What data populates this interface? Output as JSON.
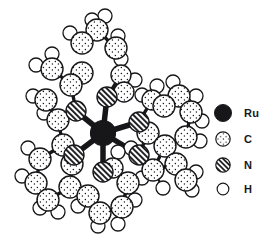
{
  "figure": {
    "kind": "molecular-structure-diagram",
    "background_color": "#ffffff",
    "line_color": "#17171a"
  },
  "legend": {
    "position": "right",
    "items": [
      {
        "key": "Ru",
        "label": "Ru",
        "swatch": "filled-black-circle",
        "color": "#17171a",
        "radius_px": 9.5
      },
      {
        "key": "C",
        "label": "C",
        "swatch": "stippled-circle",
        "color": "#ffffff",
        "radius_px": 8.0
      },
      {
        "key": "N",
        "label": "N",
        "swatch": "diagonal-hatched-circle",
        "color": "#ffffff",
        "radius_px": 8.0
      },
      {
        "key": "H",
        "label": "H",
        "swatch": "open-circle",
        "color": "#ffffff",
        "radius_px": 6.5
      }
    ]
  },
  "chart_data": {
    "type": "scatter",
    "title": "",
    "xlabel": "",
    "ylabel": "",
    "xlim": [
      0,
      210
    ],
    "ylim": [
      0,
      246
    ],
    "grid": false,
    "legend_position": "right",
    "series": [
      {
        "name": "Ru",
        "values": [
          {
            "x": 103,
            "y": 133,
            "r": 12.5
          }
        ]
      },
      {
        "name": "N",
        "values": [
          {
            "x": 107,
            "y": 97,
            "r": 10
          },
          {
            "x": 76,
            "y": 111,
            "r": 10
          },
          {
            "x": 139,
            "y": 122,
            "r": 10
          },
          {
            "x": 74,
            "y": 155,
            "r": 10
          },
          {
            "x": 139,
            "y": 155,
            "r": 10
          },
          {
            "x": 103,
            "y": 172,
            "r": 10
          }
        ]
      },
      {
        "name": "C",
        "values": [
          {
            "x": 82,
            "y": 73,
            "r": 11
          },
          {
            "x": 71,
            "y": 85,
            "r": 11
          },
          {
            "x": 52,
            "y": 69,
            "r": 11
          },
          {
            "x": 46,
            "y": 100,
            "r": 11
          },
          {
            "x": 58,
            "y": 120,
            "r": 11
          },
          {
            "x": 82,
            "y": 43,
            "r": 11
          },
          {
            "x": 97,
            "y": 30,
            "r": 11
          },
          {
            "x": 116,
            "y": 48,
            "r": 11
          },
          {
            "x": 121,
            "y": 75,
            "r": 10
          },
          {
            "x": 124,
            "y": 92,
            "r": 10
          },
          {
            "x": 152,
            "y": 100,
            "r": 10
          },
          {
            "x": 164,
            "y": 106,
            "r": 11
          },
          {
            "x": 179,
            "y": 96,
            "r": 11
          },
          {
            "x": 191,
            "y": 112,
            "r": 11
          },
          {
            "x": 186,
            "y": 137,
            "r": 11
          },
          {
            "x": 165,
            "y": 146,
            "r": 11
          },
          {
            "x": 148,
            "y": 133,
            "r": 11
          },
          {
            "x": 63,
            "y": 145,
            "r": 11
          },
          {
            "x": 40,
            "y": 159,
            "r": 11
          },
          {
            "x": 36,
            "y": 183,
            "r": 11
          },
          {
            "x": 48,
            "y": 200,
            "r": 11
          },
          {
            "x": 70,
            "y": 187,
            "r": 11
          },
          {
            "x": 72,
            "y": 164,
            "r": 11
          },
          {
            "x": 88,
            "y": 196,
            "r": 11
          },
          {
            "x": 100,
            "y": 213,
            "r": 11
          },
          {
            "x": 122,
            "y": 207,
            "r": 11
          },
          {
            "x": 128,
            "y": 183,
            "r": 11
          },
          {
            "x": 113,
            "y": 168,
            "r": 10
          },
          {
            "x": 153,
            "y": 170,
            "r": 11
          },
          {
            "x": 176,
            "y": 164,
            "r": 11
          },
          {
            "x": 186,
            "y": 180,
            "r": 11
          }
        ]
      },
      {
        "name": "H",
        "values": [
          {
            "x": 92,
            "y": 20,
            "r": 7
          },
          {
            "x": 70,
            "y": 33,
            "r": 7
          },
          {
            "x": 105,
            "y": 16,
            "r": 7
          },
          {
            "x": 52,
            "y": 54,
            "r": 7
          },
          {
            "x": 36,
            "y": 65,
            "r": 7
          },
          {
            "x": 33,
            "y": 96,
            "r": 7
          },
          {
            "x": 44,
            "y": 113,
            "r": 7
          },
          {
            "x": 121,
            "y": 59,
            "r": 7
          },
          {
            "x": 118,
            "y": 36,
            "r": 7
          },
          {
            "x": 135,
            "y": 80,
            "r": 7
          },
          {
            "x": 142,
            "y": 95,
            "r": 7
          },
          {
            "x": 157,
            "y": 86,
            "r": 7
          },
          {
            "x": 173,
            "y": 82,
            "r": 7
          },
          {
            "x": 196,
            "y": 96,
            "r": 7
          },
          {
            "x": 202,
            "y": 121,
            "r": 7
          },
          {
            "x": 200,
            "y": 141,
            "r": 7
          },
          {
            "x": 28,
            "y": 148,
            "r": 7
          },
          {
            "x": 22,
            "y": 176,
            "r": 7
          },
          {
            "x": 40,
            "y": 208,
            "r": 7
          },
          {
            "x": 58,
            "y": 212,
            "r": 7
          },
          {
            "x": 78,
            "y": 206,
            "r": 7
          },
          {
            "x": 98,
            "y": 226,
            "r": 7
          },
          {
            "x": 118,
            "y": 224,
            "r": 7
          },
          {
            "x": 135,
            "y": 200,
            "r": 7
          },
          {
            "x": 142,
            "y": 178,
            "r": 7
          },
          {
            "x": 163,
            "y": 188,
            "r": 7
          },
          {
            "x": 196,
            "y": 172,
            "r": 7
          },
          {
            "x": 192,
            "y": 190,
            "r": 7
          },
          {
            "x": 131,
            "y": 148,
            "r": 7
          },
          {
            "x": 118,
            "y": 152,
            "r": 7
          }
        ]
      }
    ]
  }
}
